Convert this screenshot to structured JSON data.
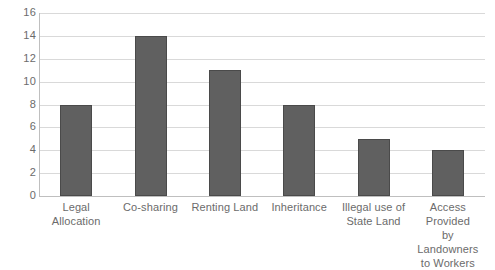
{
  "chart_data": {
    "type": "bar",
    "title": "",
    "xlabel": "",
    "ylabel": "",
    "ylim": [
      0,
      16
    ],
    "ytick_step": 2,
    "yticks": [
      "16",
      "14",
      "12",
      "10",
      "8",
      "6",
      "4",
      "2",
      "0"
    ],
    "grid": true,
    "legend": "none",
    "bar_color": "#606060",
    "gridline_color": "#d9d9d9",
    "axis_color": "#bfbfbf",
    "text_color": "#6b6b6b",
    "background": "#ffffff",
    "categories": [
      "Legal Allocation",
      "Co-sharing",
      "Renting Land",
      "Inheritance",
      "Illegal use of State Land",
      "Access Provided by Landowners to Workers"
    ],
    "category_lines": [
      [
        "Legal Allocation"
      ],
      [
        "Co-sharing"
      ],
      [
        "Renting Land"
      ],
      [
        "Inheritance"
      ],
      [
        "Illegal use of",
        "State Land"
      ],
      [
        "Access Provided",
        "by Landowners",
        "to Workers"
      ]
    ],
    "values": [
      8,
      14,
      11,
      8,
      5,
      4
    ]
  }
}
